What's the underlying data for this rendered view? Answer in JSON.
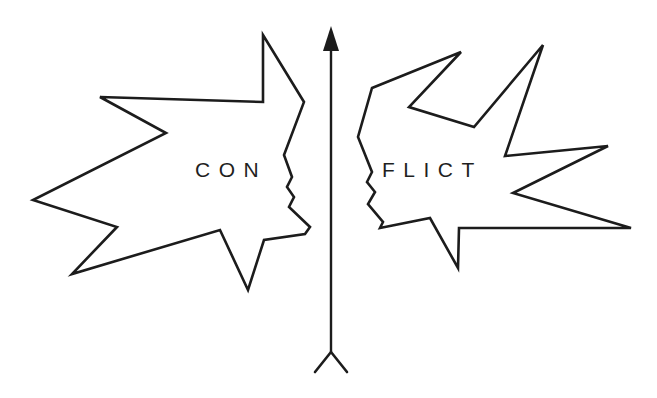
{
  "diagram": {
    "left_shape": {
      "label": "CON",
      "description": "jagged speech/burst shape with face profile facing right"
    },
    "right_shape": {
      "label": "FLICT",
      "description": "jagged speech/burst shape with face profile facing left"
    },
    "axis": {
      "type": "vertical arrow",
      "direction": "up",
      "tail": "fletched (Y-shaped) base"
    },
    "colors": {
      "line": "#1c1c1c",
      "background": "#ffffff",
      "text": "#1f1f1f"
    }
  }
}
